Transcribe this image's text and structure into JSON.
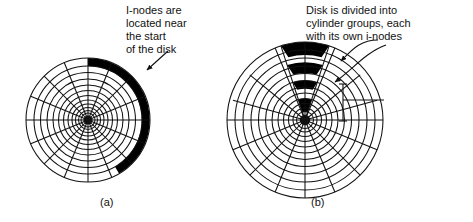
{
  "figure": {
    "title": "",
    "background_color": "#ffffff",
    "ink_color": "#111111",
    "inode_fill_color": "#000000"
  },
  "annotations": {
    "note_a": "I-nodes are\nlocated near\nthe start\nof the disk",
    "note_b": "Disk is divided into\ncylinder groups, each\nwith its own i-nodes",
    "cylinder_group_label": "Cylinder group"
  },
  "subcaptions": {
    "a": "(a)",
    "b": "(b)"
  },
  "diagram_data": {
    "type": "diagram",
    "subject": "disk platter i-node placement",
    "panels": [
      {
        "id": "a",
        "caption": "(a)",
        "center": [
          88,
          120
        ],
        "radius": 62,
        "hub_radius": 5,
        "track_count": 11,
        "sector_spokes": 16,
        "inode_region": {
          "shape": "outer-arc",
          "start_angle_deg": -90,
          "end_angle_deg": 60,
          "inner_radius": 54,
          "outer_radius": 62,
          "fill": "#000000"
        },
        "annotation": "I-nodes are located near the start of the disk",
        "leader": {
          "from": [
            168,
            52
          ],
          "to": [
            146,
            71
          ],
          "arrow": true
        }
      },
      {
        "id": "b",
        "caption": "(b)",
        "center": [
          305,
          120
        ],
        "radius": 78,
        "hub_radius": 6,
        "track_count": 11,
        "sector_spokes": 16,
        "cylinder_groups": [
          {
            "inner_radius": 66,
            "outer_radius": 78,
            "fill": "#000000"
          },
          {
            "inner_radius": 48,
            "outer_radius": 58,
            "fill": "#000000"
          },
          {
            "inner_radius": 30,
            "outer_radius": 40,
            "fill": "#000000"
          },
          {
            "inner_radius": 8,
            "outer_radius": 22,
            "fill": "#000000"
          }
        ],
        "wedge_angle_start_deg": -108,
        "wedge_angle_end_deg": -72,
        "annotation": "Disk is divided into cylinder groups, each with its own i-nodes",
        "leaders": [
          {
            "from": [
              372,
              44
            ],
            "to": [
              340,
              63
            ],
            "arrow": true
          },
          {
            "from": [
              372,
              50
            ],
            "to": [
              332,
              83
            ],
            "arrow": true
          }
        ],
        "bracket": {
          "x": 343,
          "y_top": 84,
          "y_bottom": 121,
          "label": "Cylinder group",
          "label_line_to": [
            384,
            100
          ]
        }
      }
    ]
  }
}
